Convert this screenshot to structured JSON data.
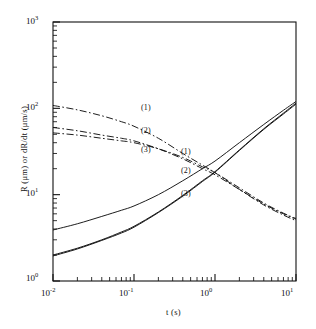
{
  "figure": {
    "kind": "log-log-plot",
    "background": "#ffffff",
    "ink": "#111111"
  },
  "axes": {
    "x": {
      "label": "t (s)",
      "scale": "log10",
      "min_exp": -2,
      "max_exp": 1,
      "tick_labels": [
        "10-2",
        "10-1",
        "100",
        "101"
      ],
      "tick_mantissa": [
        "10",
        "10",
        "10",
        "10"
      ],
      "tick_exponents": [
        "-2",
        "-1",
        "0",
        "1"
      ]
    },
    "y": {
      "label": "R (μm) or dR/dt (μm/s)",
      "scale": "log10",
      "min_exp": 0,
      "max_exp": 3,
      "tick_labels": [
        "103",
        "102",
        "101",
        "100"
      ],
      "tick_mantissa": [
        "10",
        "10",
        "10",
        "10"
      ],
      "tick_exponents": [
        "3",
        "2",
        "1",
        "0"
      ]
    }
  },
  "annotations": {
    "rate_group": [
      {
        "text": "(1)",
        "x": 141,
        "y": 104
      },
      {
        "text": "(2)",
        "x": 141,
        "y": 127
      },
      {
        "text": "(3)",
        "x": 141,
        "y": 146
      }
    ],
    "radius_group": [
      {
        "text": "(1)",
        "x": 181,
        "y": 148
      },
      {
        "text": "(2)",
        "x": 181,
        "y": 167
      },
      {
        "text": "(3)",
        "x": 181,
        "y": 190
      }
    ]
  },
  "chart_data": {
    "type": "line",
    "title": "",
    "subtitle": "",
    "xlabel": "t (s)",
    "ylabel": "R (μm) or dR/dt (μm/s)",
    "xscale": "log",
    "yscale": "log",
    "xlim": [
      0.01,
      10
    ],
    "ylim": [
      1,
      1000
    ],
    "grid": false,
    "legend": "inline-curve-labels",
    "xticks": [
      0.01,
      0.1,
      1,
      10
    ],
    "yticks": [
      1,
      10,
      100,
      1000
    ],
    "xticklabels": [
      "10^-2",
      "10^-1",
      "10^0",
      "10^1"
    ],
    "yticklabels": [
      "10^0",
      "10^1",
      "10^2",
      "10^3"
    ],
    "series": [
      {
        "name": "(1) dR/dt",
        "label": "(1)",
        "quantity": "dR/dt",
        "units": "μm/s",
        "style": "dash-dot",
        "x": [
          0.01,
          0.02,
          0.04,
          0.07,
          0.1,
          0.2,
          0.4,
          0.7,
          1.0,
          2.0,
          4.0,
          7.0,
          10.0
        ],
        "y": [
          108,
          96,
          82,
          70,
          62,
          45,
          30,
          22,
          18,
          11.5,
          7.6,
          5.8,
          5.0
        ]
      },
      {
        "name": "(2) dR/dt",
        "label": "(2)",
        "quantity": "dR/dt",
        "units": "μm/s",
        "style": "dash-dot",
        "x": [
          0.01,
          0.02,
          0.04,
          0.07,
          0.1,
          0.2,
          0.4,
          0.7,
          1.0,
          2.0,
          4.0,
          7.0,
          10.0
        ],
        "y": [
          60,
          55,
          49,
          45,
          42,
          34,
          26,
          20,
          17,
          11.5,
          7.8,
          6.0,
          5.2
        ]
      },
      {
        "name": "(3) dR/dt",
        "label": "(3)",
        "quantity": "dR/dt",
        "units": "μm/s",
        "style": "dash-dot",
        "x": [
          0.01,
          0.02,
          0.04,
          0.07,
          0.1,
          0.2,
          0.4,
          0.7,
          1.0,
          2.0,
          4.0,
          7.0,
          10.0
        ],
        "y": [
          52,
          49,
          45,
          42,
          40,
          34,
          27,
          21,
          18,
          12.0,
          8.0,
          6.1,
          5.3
        ]
      },
      {
        "name": "(1) R",
        "label": "(1)",
        "quantity": "R",
        "units": "μm",
        "style": "solid",
        "x": [
          0.01,
          0.02,
          0.04,
          0.07,
          0.1,
          0.2,
          0.4,
          0.7,
          1.0,
          2.0,
          4.0,
          7.0,
          10.0
        ],
        "y": [
          3.9,
          4.6,
          5.6,
          6.6,
          7.4,
          10.0,
          14.5,
          20.0,
          24.5,
          40.0,
          65.0,
          95.0,
          120.0
        ]
      },
      {
        "name": "(2) R",
        "label": "(2)",
        "quantity": "R",
        "units": "μm",
        "style": "solid",
        "x": [
          0.01,
          0.02,
          0.04,
          0.07,
          0.1,
          0.2,
          0.4,
          0.7,
          1.0,
          2.0,
          4.0,
          7.0,
          10.0
        ],
        "y": [
          2.0,
          2.4,
          3.0,
          3.7,
          4.3,
          6.3,
          9.8,
          14.5,
          18.5,
          33.0,
          58.0,
          88.0,
          115.0
        ]
      },
      {
        "name": "(3) R",
        "label": "(3)",
        "quantity": "R",
        "units": "μm",
        "style": "solid",
        "x": [
          0.01,
          0.02,
          0.04,
          0.07,
          0.1,
          0.2,
          0.4,
          0.7,
          1.0,
          2.0,
          4.0,
          7.0,
          10.0
        ],
        "y": [
          1.95,
          2.35,
          2.95,
          3.6,
          4.2,
          6.2,
          9.6,
          14.2,
          18.2,
          32.5,
          57.0,
          86.0,
          112.0
        ]
      }
    ]
  }
}
